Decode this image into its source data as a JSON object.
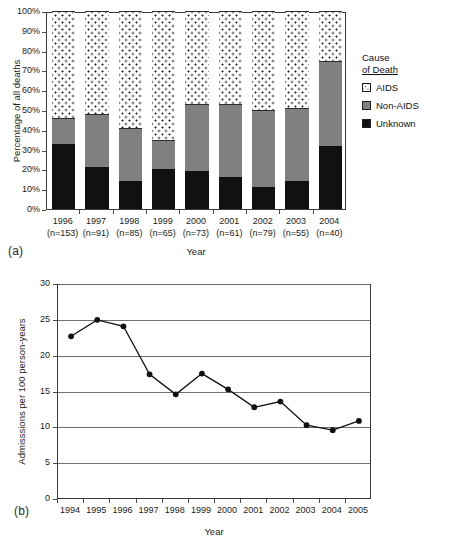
{
  "figure": {
    "panel_a_label": "(a)",
    "panel_b_label": "(b)"
  },
  "chart_data": [
    {
      "type": "bar",
      "panel": "(a)",
      "stacked": true,
      "percent": true,
      "title": "",
      "xlabel": "Year",
      "ylabel": "Percentage of all deaths",
      "ylim": [
        0,
        100
      ],
      "yticks": [
        "0%",
        "10%",
        "20%",
        "30%",
        "40%",
        "50%",
        "60%",
        "70%",
        "80%",
        "90%",
        "100%"
      ],
      "ytick_values": [
        0,
        10,
        20,
        30,
        40,
        50,
        60,
        70,
        80,
        90,
        100
      ],
      "grid": false,
      "legend_position": "right",
      "legend_title_line1": "Cause",
      "legend_title_line2": "of Death",
      "categories": [
        "1996",
        "1997",
        "1998",
        "1999",
        "2000",
        "2001",
        "2002",
        "2003",
        "2004"
      ],
      "category_sublabels": [
        "(n=153)",
        "(n=91)",
        "(n=85)",
        "(n=65)",
        "(n=73)",
        "(n=61)",
        "(n=79)",
        "(n=55)",
        "(n=40)"
      ],
      "n_values": [
        153,
        91,
        85,
        65,
        73,
        61,
        79,
        55,
        40
      ],
      "series": [
        {
          "name": "Unknown",
          "color": "#111111",
          "fill": "solid-black",
          "values": [
            33,
            21,
            14,
            20,
            19,
            16,
            11,
            14,
            32
          ]
        },
        {
          "name": "Non-AIDS",
          "color": "#808080",
          "fill": "solid-gray",
          "values": [
            13,
            27,
            27,
            15,
            34,
            37,
            39,
            37,
            43
          ]
        },
        {
          "name": "AIDS",
          "color": "#ffffff",
          "fill": "dotted",
          "values": [
            54,
            52,
            59,
            65,
            47,
            47,
            50,
            49,
            25
          ]
        }
      ],
      "cumulative_tops": {
        "unknown": [
          33,
          21,
          14,
          20,
          19,
          16,
          11,
          14,
          32
        ],
        "nonaids": [
          46,
          48,
          41,
          35,
          53,
          53,
          50,
          51,
          75
        ]
      }
    },
    {
      "type": "line",
      "panel": "(b)",
      "title": "",
      "xlabel": "Year",
      "ylabel": "Admisssions per 100 person-years",
      "ylim": [
        0,
        30
      ],
      "yticks": [
        "0",
        "5",
        "10",
        "15",
        "20",
        "25",
        "30"
      ],
      "ytick_values": [
        0,
        5,
        10,
        15,
        20,
        25,
        30
      ],
      "grid": true,
      "legend_position": "top-right",
      "x": [
        "1994",
        "1995",
        "1996",
        "1997",
        "1998",
        "1999",
        "2000",
        "2001",
        "2002",
        "2003",
        "2004",
        "2005"
      ],
      "series": [
        {
          "name": "All Causes",
          "color": "#111111",
          "marker": "filled-circle",
          "values": [
            22.7,
            25.0,
            24.1,
            17.4,
            14.6,
            17.5,
            15.3,
            12.8,
            13.6,
            10.3,
            9.6,
            10.9
          ]
        }
      ]
    }
  ]
}
